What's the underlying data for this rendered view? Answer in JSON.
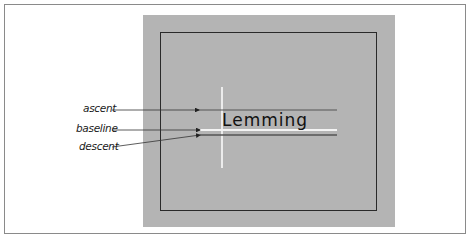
{
  "diagram": {
    "sample_text": "Lemming",
    "labels": {
      "ascent": "ascent",
      "baseline": "baseline",
      "descent": "descent"
    },
    "colors": {
      "panel": "#b4b4b4",
      "frame_border": "#8a8a8a",
      "inner_border": "#2a2a2a",
      "metric_line": "#555555",
      "guide_line": "#ffffff"
    }
  }
}
